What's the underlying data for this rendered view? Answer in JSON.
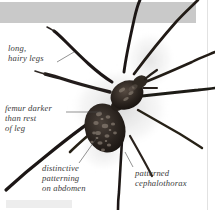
{
  "figure": {
    "caption_style": "italic-serif",
    "background_color": "#ffffff",
    "band_color": "#c9c9c9",
    "text_color": "#3b3b3b",
    "leader_color": "#4a4a4a",
    "body_color": "#221c18",
    "abdomen_color": "#2e2722"
  },
  "annotations": [
    {
      "id": "long-hairy-legs",
      "text": "long,\nhairy legs",
      "target": "legs"
    },
    {
      "id": "femur-darker",
      "text": "femur darker\nthan rest\nof leg",
      "target": "femur"
    },
    {
      "id": "abdomen-pattern",
      "text": "distinctive\npatterning\non abdomen",
      "target": "abdomen"
    },
    {
      "id": "patterned-cephalothorax",
      "text": "patterned\ncephalothorax",
      "target": "cephalothorax"
    }
  ]
}
